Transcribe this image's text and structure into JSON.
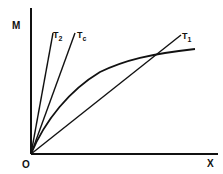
{
  "diagram": {
    "type": "line-diagram",
    "axes": {
      "y_label": "M",
      "x_label": "X",
      "origin_label": "O"
    },
    "lines": [
      {
        "name": "T2",
        "label_main": "T",
        "label_sub": "2",
        "from": [
          31,
          154
        ],
        "to": [
          53,
          32
        ]
      },
      {
        "name": "Tc",
        "label_main": "T",
        "label_sub": "c",
        "from": [
          31,
          154
        ],
        "to": [
          75,
          32
        ]
      },
      {
        "name": "T1",
        "label_main": "T",
        "label_sub": "1",
        "from": [
          31,
          154
        ],
        "to": [
          182,
          33
        ]
      }
    ],
    "curve": {
      "name": "magnetization-curve",
      "description": "concave curve from origin rising and flattening, crossing T1 line"
    },
    "colors": {
      "stroke": "#111111",
      "background": "#ffffff"
    }
  }
}
